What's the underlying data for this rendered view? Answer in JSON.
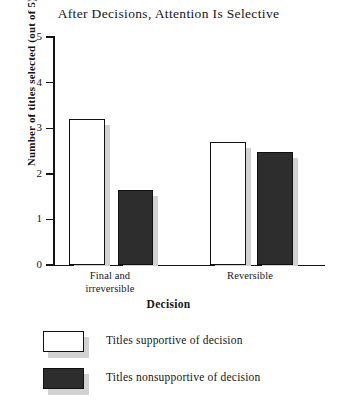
{
  "chart_data": {
    "type": "bar",
    "title": "After Decisions, Attention Is Selective",
    "xlabel": "Decision",
    "ylabel": "Number of titles selected (out of 5)",
    "categories": [
      "Final and irreversible",
      "Reversible"
    ],
    "category_lines": [
      [
        "Final and",
        "irreversible"
      ],
      [
        "Reversible"
      ]
    ],
    "series": [
      {
        "name": "Titles supportive of decision",
        "style": "open",
        "color": "#ffffff",
        "values": [
          3.2,
          2.7
        ]
      },
      {
        "name": "Titles nonsupportive of decision",
        "style": "filled",
        "color": "#2d2d2d",
        "values": [
          1.65,
          2.48
        ]
      }
    ],
    "ylim": [
      0,
      5
    ],
    "yticks": [
      "0",
      "1",
      "2",
      "3",
      "4",
      "5"
    ],
    "grid": false,
    "legend_position": "below-plot",
    "axis_color": "#141414",
    "shadow_color": "#d2d2d2"
  }
}
